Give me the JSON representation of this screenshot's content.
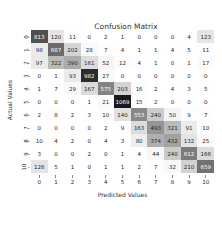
{
  "chart_data": {
    "type": "heatmap",
    "title": "Confusion Matrix",
    "xlabel": "Predicted Values",
    "ylabel": "Actual Values",
    "x_ticks": [
      "0",
      "1",
      "2",
      "3",
      "4",
      "5",
      "6",
      "7",
      "8",
      "9",
      "10"
    ],
    "y_ticks": [
      "0",
      "1",
      "2",
      "3",
      "4",
      "5",
      "6",
      "7",
      "8",
      "9",
      "10"
    ],
    "colormap": "Greys",
    "matrix": [
      [
        813,
        120,
        11,
        0,
        2,
        1,
        0,
        0,
        0,
        4,
        123
      ],
      [
        98,
        687,
        202,
        28,
        7,
        4,
        1,
        1,
        4,
        5,
        11
      ],
      [
        97,
        322,
        390,
        161,
        52,
        12,
        4,
        1,
        0,
        1,
        17
      ],
      [
        0,
        1,
        93,
        982,
        27,
        0,
        0,
        0,
        0,
        0,
        0
      ],
      [
        1,
        7,
        29,
        167,
        575,
        203,
        16,
        2,
        4,
        3,
        5
      ],
      [
        0,
        0,
        0,
        1,
        21,
        1069,
        15,
        2,
        0,
        0,
        0
      ],
      [
        2,
        8,
        2,
        3,
        10,
        140,
        553,
        240,
        50,
        9,
        7
      ],
      [
        0,
        0,
        0,
        0,
        2,
        9,
        163,
        493,
        321,
        91,
        10
      ],
      [
        10,
        4,
        2,
        0,
        4,
        3,
        80,
        374,
        432,
        132,
        25
      ],
      [
        3,
        0,
        0,
        2,
        0,
        1,
        4,
        44,
        240,
        612,
        166
      ],
      [
        126,
        5,
        1,
        0,
        1,
        1,
        2,
        7,
        32,
        210,
        659
      ]
    ],
    "vmin": 0,
    "vmax": 1069
  }
}
